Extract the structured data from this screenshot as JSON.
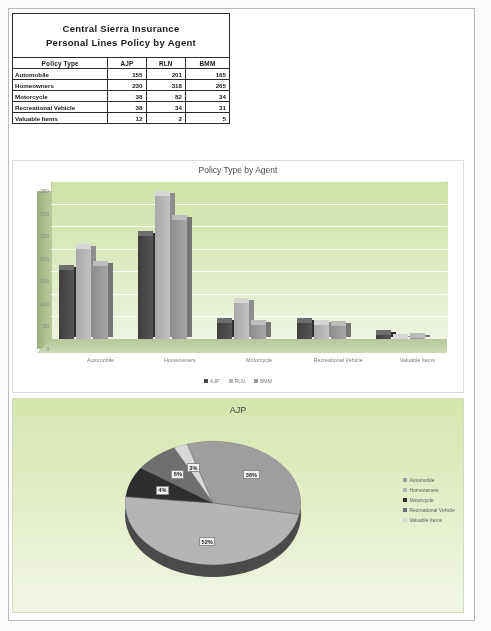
{
  "report": {
    "title_line1": "Central Sierra Insurance",
    "title_line2": "Personal Lines Policy by Agent"
  },
  "table": {
    "headers": [
      "Policy Type",
      "AJP",
      "RLN",
      "BMM"
    ],
    "rows": [
      {
        "type": "Automobile",
        "ajp": "155",
        "rln": "201",
        "bmm": "165"
      },
      {
        "type": "Homeowners",
        "ajp": "230",
        "rln": "318",
        "bmm": "265"
      },
      {
        "type": "Motorcycle",
        "ajp": "38",
        "rln": "82",
        "bmm": "34"
      },
      {
        "type": "Recreational Vehicle",
        "ajp": "38",
        "rln": "34",
        "bmm": "31"
      },
      {
        "type": "Valuable Items",
        "ajp": "12",
        "rln": "2",
        "bmm": "5"
      }
    ]
  },
  "bar_chart": {
    "title": "Policy Type by Agent",
    "y_ticks": [
      "350",
      "300",
      "250",
      "200",
      "150",
      "100",
      "50",
      "0"
    ],
    "legend": [
      "AJP",
      "RLN",
      "BMM"
    ]
  },
  "pie_chart": {
    "title": "AJP",
    "slice_labels": [
      "36%",
      "52%",
      "4%",
      "6%",
      "3%"
    ],
    "legend": [
      "Automobile",
      "Homeowners",
      "Motorcycle",
      "Recreational Vehicle",
      "Valuable Items"
    ]
  },
  "chart_data": [
    {
      "type": "bar",
      "title": "Policy Type by Agent",
      "categories": [
        "Automobile",
        "Homeowners",
        "Motorcycle",
        "Recreational Vehicle",
        "Valuable Items"
      ],
      "series": [
        {
          "name": "AJP",
          "values": [
            155,
            230,
            38,
            38,
            12
          ],
          "color": "#4a4a4a"
        },
        {
          "name": "RLN",
          "values": [
            201,
            318,
            82,
            34,
            2
          ],
          "color": "#b8b8b8"
        },
        {
          "name": "BMM",
          "values": [
            165,
            265,
            34,
            31,
            5
          ],
          "color": "#9a9a9a"
        }
      ],
      "xlabel": "",
      "ylabel": "",
      "ylim": [
        0,
        350
      ],
      "grid": true,
      "legend_position": "bottom",
      "style": "3d-column"
    },
    {
      "type": "pie",
      "title": "AJP",
      "categories": [
        "Automobile",
        "Homeowners",
        "Motorcycle",
        "Recreational Vehicle",
        "Valuable Items"
      ],
      "values": [
        155,
        230,
        38,
        38,
        12
      ],
      "percent_labels": [
        "36%",
        "52%",
        "4%",
        "6%",
        "3%"
      ],
      "colors": [
        "#9e9e9e",
        "#b5b5b5",
        "#2e2e2e",
        "#6f6f6f",
        "#d8d8d8"
      ],
      "legend_position": "right",
      "style": "3d-pie"
    }
  ]
}
